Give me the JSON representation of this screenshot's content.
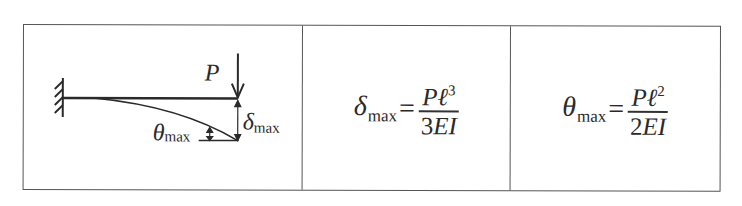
{
  "table": {
    "columns": [
      {
        "type": "diagram",
        "description": "Cantilever beam with point load at free end",
        "labels": {
          "load": "P",
          "deflection_symbol": "δ",
          "deflection_sub": "max",
          "angle_symbol": "θ",
          "angle_sub": "max"
        }
      },
      {
        "type": "formula",
        "lhs_symbol": "δ",
        "lhs_sub": "max",
        "equals": "=",
        "numerator": "Pℓ",
        "numerator_exp": "3",
        "denominator_coef": "3",
        "denominator_rest": "EI"
      },
      {
        "type": "formula",
        "lhs_symbol": "θ",
        "lhs_sub": "max",
        "equals": "=",
        "numerator": "Pℓ",
        "numerator_exp": "2",
        "denominator_coef": "2",
        "denominator_rest": "EI"
      }
    ]
  }
}
